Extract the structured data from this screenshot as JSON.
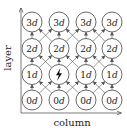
{
  "axes": {
    "x_label": "column",
    "y_label": "layer"
  },
  "grid": {
    "columns": 4,
    "layers": 4,
    "rows": [
      {
        "layer": 3,
        "labels": [
          {
            "num": "3",
            "var": "d"
          },
          {
            "num": "3",
            "var": "d"
          },
          {
            "num": "3",
            "var": "d"
          },
          {
            "num": "3",
            "var": "d"
          }
        ]
      },
      {
        "layer": 2,
        "labels": [
          {
            "num": "2",
            "var": "d"
          },
          {
            "num": "2",
            "var": "d"
          },
          {
            "num": "2",
            "var": "d"
          },
          {
            "num": "2",
            "var": "d"
          }
        ]
      },
      {
        "layer": 1,
        "labels": [
          {
            "num": "1",
            "var": "d"
          },
          {
            "icon": "lightning-bolt-icon"
          },
          {
            "num": "1",
            "var": "d"
          },
          {
            "num": "1",
            "var": "d"
          }
        ]
      },
      {
        "layer": 0,
        "labels": [
          {
            "num": "0",
            "var": "d"
          },
          {
            "num": "0",
            "var": "d"
          },
          {
            "num": "0",
            "var": "d"
          },
          {
            "num": "0",
            "var": "d"
          }
        ]
      }
    ],
    "edges": "each node receives a vertical arrow from the node directly below and diagonal arrows from the adjacent-column nodes below"
  }
}
